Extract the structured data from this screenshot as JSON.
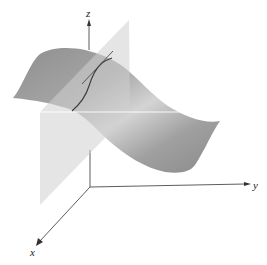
{
  "figure": {
    "axes": {
      "x_label": "x",
      "y_label": "y",
      "z_label": "z"
    },
    "elements": [
      {
        "name": "surface",
        "shape": "wavy saddle-like sheet",
        "shade": "gray gradient"
      },
      {
        "name": "vertical-plane",
        "shape": "translucent parallelogram",
        "shade": "light gray"
      },
      {
        "name": "intersection-curve",
        "shape": "curve on surface within plane"
      },
      {
        "name": "tangent-line",
        "shape": "line tangent to curve"
      },
      {
        "name": "trace-line",
        "shape": "white horizontal line where plane meets surface level"
      }
    ],
    "colors": {
      "background": "#ffffff",
      "surface_dark": "#8c8c8c",
      "surface_light": "#d9d9d9",
      "plane": "#c8c8c8",
      "curve": "#3a3a3a",
      "axis": "#333333"
    }
  }
}
